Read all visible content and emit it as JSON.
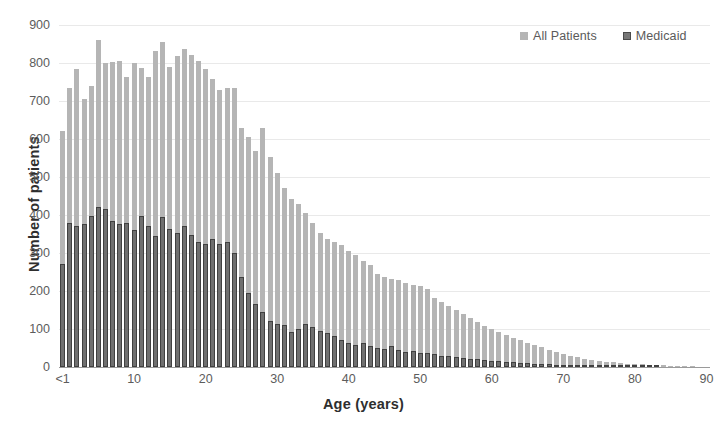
{
  "chart_data": {
    "type": "bar",
    "title": "",
    "xlabel": "Age (years)",
    "ylabel": "Number of patients",
    "ylim": [
      0,
      900
    ],
    "xlim": [
      0,
      90
    ],
    "ytick_step": 100,
    "yticks": [
      0,
      100,
      200,
      300,
      400,
      500,
      600,
      700,
      800,
      900
    ],
    "ytick_labels": [
      "0",
      "100",
      "200",
      "300",
      "400",
      "500",
      "600",
      "700",
      "800",
      "900"
    ],
    "xticks": [
      0,
      10,
      20,
      30,
      40,
      50,
      60,
      70,
      80,
      90
    ],
    "xtick_labels": [
      "<1",
      "10",
      "20",
      "30",
      "40",
      "50",
      "60",
      "70",
      "80",
      "90"
    ],
    "grid": "horizontal",
    "legend_position": "top-right",
    "bar_overlap": "overlay",
    "colors": {
      "all_patients": "#b5b5b5",
      "medicaid_fill": "#6f6f6f",
      "medicaid_edge": "#404040",
      "gridline": "#e9e9e9",
      "axis": "#9a9a9a",
      "tick_text": "#5c5c5c",
      "axis_title": "#2e2e2e"
    },
    "categories": [
      "<1",
      "1",
      "2",
      "3",
      "4",
      "5",
      "6",
      "7",
      "8",
      "9",
      "10",
      "11",
      "12",
      "13",
      "14",
      "15",
      "16",
      "17",
      "18",
      "19",
      "20",
      "21",
      "22",
      "23",
      "24",
      "25",
      "26",
      "27",
      "28",
      "29",
      "30",
      "31",
      "32",
      "33",
      "34",
      "35",
      "36",
      "37",
      "38",
      "39",
      "40",
      "41",
      "42",
      "43",
      "44",
      "45",
      "46",
      "47",
      "48",
      "49",
      "50",
      "51",
      "52",
      "53",
      "54",
      "55",
      "56",
      "57",
      "58",
      "59",
      "60",
      "61",
      "62",
      "63",
      "64",
      "65",
      "66",
      "67",
      "68",
      "69",
      "70",
      "71",
      "72",
      "73",
      "74",
      "75",
      "76",
      "77",
      "78",
      "79",
      "80",
      "81",
      "82",
      "83",
      "84",
      "85",
      "86",
      "87",
      "88",
      "89",
      "90"
    ],
    "series": [
      {
        "name": "All Patients",
        "color": "#b5b5b5",
        "values": [
          620,
          733,
          785,
          706,
          740,
          861,
          800,
          803,
          805,
          764,
          800,
          786,
          764,
          832,
          855,
          790,
          818,
          836,
          822,
          806,
          785,
          759,
          730,
          733,
          733,
          628,
          605,
          568,
          630,
          552,
          510,
          470,
          442,
          430,
          404,
          380,
          352,
          338,
          330,
          322,
          304,
          295,
          280,
          268,
          245,
          238,
          232,
          228,
          222,
          217,
          212,
          204,
          182,
          170,
          160,
          150,
          140,
          128,
          118,
          108,
          100,
          92,
          84,
          76,
          70,
          64,
          58,
          52,
          46,
          40,
          34,
          30,
          26,
          22,
          19,
          16,
          14,
          12,
          10,
          9,
          8,
          7,
          6,
          5,
          4,
          3,
          3,
          2,
          2,
          1,
          1
        ]
      },
      {
        "name": "Medicaid",
        "color": "#6f6f6f",
        "values": [
          270,
          380,
          372,
          376,
          398,
          420,
          415,
          385,
          376,
          380,
          360,
          398,
          370,
          345,
          395,
          363,
          352,
          370,
          348,
          330,
          325,
          336,
          324,
          330,
          300,
          236,
          196,
          165,
          146,
          120,
          114,
          110,
          92,
          100,
          112,
          106,
          96,
          90,
          82,
          72,
          62,
          58,
          62,
          54,
          50,
          48,
          56,
          44,
          40,
          42,
          38,
          36,
          34,
          30,
          28,
          26,
          24,
          22,
          20,
          18,
          16,
          15,
          13,
          12,
          11,
          10,
          9,
          8,
          7,
          6,
          5,
          5,
          4,
          4,
          3,
          3,
          2,
          2,
          2,
          1,
          1,
          1,
          1,
          1,
          0,
          0,
          0,
          0,
          0,
          0,
          0
        ]
      }
    ]
  },
  "legend": {
    "items": [
      {
        "label": "All Patients",
        "swatch": "all-patients-swatch"
      },
      {
        "label": "Medicaid",
        "swatch": "medicaid-swatch"
      }
    ]
  }
}
